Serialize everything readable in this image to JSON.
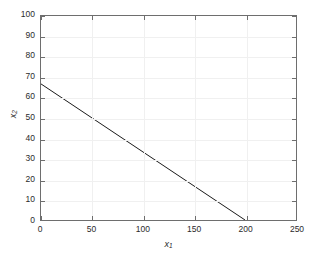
{
  "chart_data": {
    "type": "line",
    "title": "",
    "xlabel": "x₁",
    "ylabel": "x₂",
    "xlabel_base": "x",
    "xlabel_sub": "1",
    "ylabel_base": "x",
    "ylabel_sub": "2",
    "xlim": [
      0,
      250
    ],
    "ylim": [
      0,
      100
    ],
    "xticks": [
      0,
      50,
      100,
      150,
      200,
      250
    ],
    "yticks": [
      0,
      10,
      20,
      30,
      40,
      50,
      60,
      70,
      80,
      90,
      100
    ],
    "xtick_labels": [
      "0",
      "50",
      "100",
      "150",
      "200",
      "250"
    ],
    "ytick_labels": [
      "0",
      "10",
      "20",
      "30",
      "40",
      "50",
      "60",
      "70",
      "80",
      "90",
      "100"
    ],
    "grid": true,
    "grid_color": "#f0f0f0",
    "legend": null,
    "background_color": "#ffffff",
    "axis_color": "#6e6e6e",
    "series": [
      {
        "name": "constraint-line",
        "color": "#1a1a1a",
        "linewidth": 1,
        "x": [
          0,
          200
        ],
        "y": [
          66.7,
          0
        ]
      }
    ]
  }
}
